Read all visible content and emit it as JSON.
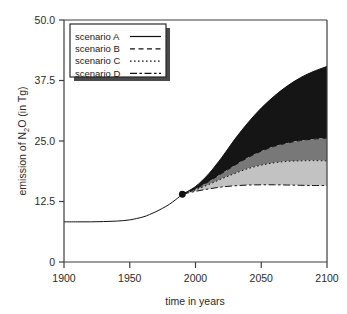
{
  "figure": {
    "background_color": "#ffffff",
    "frame_color": "#3c3c3c"
  },
  "chart_data": {
    "type": "area",
    "title": "",
    "subtitle": "",
    "xlabel": "time in years",
    "ylabel": "emission of N2O  (in Tg)",
    "ylabel_parts": {
      "pre": "emission of N",
      "sub": "2",
      "post": "O  (in Tg)"
    },
    "xlim": [
      1900,
      2100
    ],
    "ylim": [
      0,
      50
    ],
    "xticks": [
      1900,
      1950,
      2000,
      2050,
      2100
    ],
    "xtick_labels": [
      "1900",
      "1950",
      "2000",
      "2050",
      "2100"
    ],
    "yticks": [
      0,
      12.5,
      25.0,
      37.5,
      50.0
    ],
    "ytick_labels": [
      "0",
      "12.5",
      "25.0",
      "37.5",
      "50.0"
    ],
    "grid": false,
    "legend_position": "top-left",
    "branch_point": {
      "x": 1990,
      "y": 14.0,
      "marker": "filled-circle"
    },
    "historical": {
      "name": "historical",
      "x": [
        1900,
        1910,
        1920,
        1930,
        1940,
        1950,
        1960,
        1965,
        1970,
        1975,
        1980,
        1985,
        1990
      ],
      "y": [
        8.3,
        8.3,
        8.3,
        8.35,
        8.45,
        8.7,
        9.3,
        9.8,
        10.4,
        11.1,
        11.9,
        12.9,
        14.0
      ]
    },
    "series": [
      {
        "name": "scenario A",
        "line_style": "solid",
        "band_color": "#151515",
        "x": [
          1990,
          2000,
          2010,
          2020,
          2030,
          2040,
          2050,
          2060,
          2070,
          2080,
          2090,
          2100
        ],
        "values": [
          14.0,
          15.6,
          18.2,
          21.6,
          25.4,
          28.8,
          31.8,
          34.3,
          36.4,
          38.1,
          39.4,
          40.4
        ]
      },
      {
        "name": "scenario B",
        "line_style": "dashed",
        "band_color": "#787878",
        "x": [
          1990,
          2000,
          2010,
          2020,
          2030,
          2040,
          2050,
          2060,
          2070,
          2080,
          2090,
          2100
        ],
        "values": [
          14.0,
          15.1,
          16.6,
          18.3,
          20.0,
          21.6,
          22.9,
          23.9,
          24.6,
          25.1,
          25.4,
          25.6
        ]
      },
      {
        "name": "scenario C",
        "line_style": "dotted",
        "band_color": "#c2c2c2",
        "x": [
          1990,
          2000,
          2010,
          2020,
          2030,
          2040,
          2050,
          2060,
          2070,
          2080,
          2090,
          2100
        ],
        "values": [
          14.0,
          14.9,
          16.0,
          17.2,
          18.3,
          19.3,
          20.0,
          20.5,
          20.8,
          20.9,
          20.95,
          20.9
        ]
      },
      {
        "name": "scenario D",
        "line_style": "dashdot",
        "band_color": "#ffffff",
        "x": [
          1990,
          2000,
          2010,
          2020,
          2030,
          2040,
          2050,
          2060,
          2070,
          2080,
          2090,
          2100
        ],
        "values": [
          14.0,
          14.6,
          15.1,
          15.5,
          15.75,
          15.9,
          15.95,
          15.95,
          15.9,
          15.85,
          15.8,
          15.8
        ]
      }
    ]
  },
  "legend": {
    "entries": [
      {
        "label": "scenario A",
        "style": "solid"
      },
      {
        "label": "scenario B",
        "style": "dashed"
      },
      {
        "label": "scenario C",
        "style": "dotted"
      },
      {
        "label": "scenario D",
        "style": "dashdot"
      }
    ]
  }
}
